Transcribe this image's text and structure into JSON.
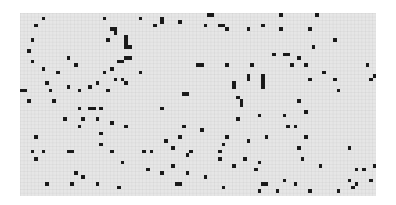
{
  "game": {
    "type": "cellular-automaton-grid",
    "cell_size_px": 3.6,
    "cols": 99,
    "rows": 51,
    "colors": {
      "dead": "#e6e6e6",
      "alive": "#1a1a1a",
      "grid_line": "#dcdcdc"
    },
    "live_cells": [
      [
        6,
        1
      ],
      [
        4,
        3
      ],
      [
        3,
        7
      ],
      [
        2,
        10
      ],
      [
        3,
        13
      ],
      [
        13,
        12
      ],
      [
        10,
        16
      ],
      [
        7,
        19
      ],
      [
        13,
        20
      ],
      [
        23,
        1
      ],
      [
        33,
        1
      ],
      [
        39,
        2
      ],
      [
        39,
        1
      ],
      [
        25,
        4
      ],
      [
        26,
        4
      ],
      [
        26,
        5
      ],
      [
        24,
        7
      ],
      [
        29,
        6
      ],
      [
        29,
        7
      ],
      [
        29,
        8
      ],
      [
        29,
        9
      ],
      [
        30,
        9
      ],
      [
        29,
        12
      ],
      [
        30,
        12
      ],
      [
        25,
        15
      ],
      [
        23,
        16
      ],
      [
        21,
        19
      ],
      [
        19,
        20
      ],
      [
        24,
        21
      ],
      [
        0,
        21
      ],
      [
        8,
        21
      ],
      [
        16,
        21
      ],
      [
        37,
        3
      ],
      [
        44,
        2
      ],
      [
        51,
        3
      ],
      [
        52,
        0
      ],
      [
        53,
        0
      ],
      [
        55,
        3
      ],
      [
        56,
        3
      ],
      [
        57,
        4
      ],
      [
        63,
        4
      ],
      [
        67,
        3
      ],
      [
        72,
        0
      ],
      [
        72,
        4
      ],
      [
        70,
        11
      ],
      [
        74,
        11
      ],
      [
        77,
        12
      ],
      [
        82,
        0
      ],
      [
        80,
        4
      ],
      [
        87,
        7
      ],
      [
        81,
        9
      ],
      [
        73,
        11
      ],
      [
        6,
        15
      ],
      [
        15,
        14
      ],
      [
        26,
        18
      ],
      [
        33,
        16
      ],
      [
        29,
        19
      ],
      [
        28,
        18
      ],
      [
        27,
        13
      ],
      [
        28,
        13
      ],
      [
        1,
        21
      ],
      [
        46,
        22
      ],
      [
        49,
        14
      ],
      [
        50,
        14
      ],
      [
        45,
        22
      ],
      [
        57,
        14
      ],
      [
        64,
        14
      ],
      [
        75,
        14
      ],
      [
        79,
        14
      ],
      [
        59,
        19
      ],
      [
        59,
        20
      ],
      [
        60,
        23
      ],
      [
        61,
        24
      ],
      [
        61,
        25
      ],
      [
        67,
        17
      ],
      [
        67,
        18
      ],
      [
        67,
        19
      ],
      [
        67,
        20
      ],
      [
        63,
        17
      ],
      [
        63,
        18
      ],
      [
        77,
        24
      ],
      [
        80,
        18
      ],
      [
        84,
        16
      ],
      [
        87,
        18
      ],
      [
        88,
        21
      ],
      [
        97,
        18
      ],
      [
        96,
        14
      ],
      [
        98,
        17
      ],
      [
        2,
        24
      ],
      [
        9,
        24
      ],
      [
        16,
        26
      ],
      [
        17,
        29
      ],
      [
        16,
        31
      ],
      [
        12,
        29
      ],
      [
        19,
        26
      ],
      [
        20,
        26
      ],
      [
        22,
        26
      ],
      [
        21,
        29
      ],
      [
        25,
        30
      ],
      [
        29,
        31
      ],
      [
        4,
        34
      ],
      [
        13,
        38
      ],
      [
        22,
        33
      ],
      [
        22,
        36
      ],
      [
        25,
        38
      ],
      [
        39,
        26
      ],
      [
        45,
        31
      ],
      [
        50,
        32
      ],
      [
        40,
        35
      ],
      [
        42,
        37
      ],
      [
        44,
        34
      ],
      [
        60,
        29
      ],
      [
        57,
        34
      ],
      [
        56,
        36
      ],
      [
        55,
        38
      ],
      [
        63,
        35
      ],
      [
        66,
        28
      ],
      [
        73,
        28
      ],
      [
        74,
        31
      ],
      [
        68,
        34
      ],
      [
        79,
        27
      ],
      [
        76,
        31
      ],
      [
        79,
        34
      ],
      [
        77,
        37
      ],
      [
        91,
        37
      ],
      [
        3,
        38
      ],
      [
        6,
        38
      ],
      [
        4,
        40
      ],
      [
        14,
        38
      ],
      [
        15,
        44
      ],
      [
        28,
        41
      ],
      [
        34,
        38
      ],
      [
        36,
        38
      ],
      [
        39,
        44
      ],
      [
        35,
        43
      ],
      [
        42,
        42
      ],
      [
        47,
        38
      ],
      [
        46,
        39
      ],
      [
        46,
        44
      ],
      [
        51,
        45
      ],
      [
        44,
        47
      ],
      [
        27,
        48
      ],
      [
        43,
        47
      ],
      [
        7,
        47
      ],
      [
        21,
        47
      ],
      [
        14,
        47
      ],
      [
        55,
        40
      ],
      [
        59,
        42
      ],
      [
        62,
        40
      ],
      [
        65,
        43
      ],
      [
        66,
        41
      ],
      [
        67,
        47
      ],
      [
        68,
        47
      ],
      [
        76,
        47
      ],
      [
        73,
        46
      ],
      [
        78,
        40
      ],
      [
        83,
        42
      ],
      [
        71,
        49
      ],
      [
        80,
        49
      ],
      [
        88,
        49
      ],
      [
        92,
        48
      ],
      [
        93,
        47
      ],
      [
        91,
        46
      ],
      [
        93,
        43
      ],
      [
        95,
        43
      ],
      [
        98,
        42
      ],
      [
        97,
        46
      ],
      [
        17,
        45
      ],
      [
        56,
        48
      ],
      [
        66,
        49
      ]
    ]
  }
}
